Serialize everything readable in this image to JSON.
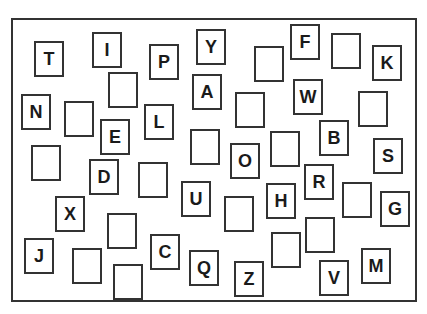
{
  "cards": [
    {
      "letter": "T",
      "x": 34,
      "y": 41
    },
    {
      "letter": "I",
      "x": 92,
      "y": 32
    },
    {
      "letter": "",
      "x": 108,
      "y": 72
    },
    {
      "letter": "P",
      "x": 149,
      "y": 44
    },
    {
      "letter": "Y",
      "x": 196,
      "y": 29
    },
    {
      "letter": "A",
      "x": 192,
      "y": 74
    },
    {
      "letter": "",
      "x": 254,
      "y": 46
    },
    {
      "letter": "F",
      "x": 290,
      "y": 24
    },
    {
      "letter": "",
      "x": 331,
      "y": 33
    },
    {
      "letter": "K",
      "x": 372,
      "y": 45
    },
    {
      "letter": "N",
      "x": 21,
      "y": 94
    },
    {
      "letter": "",
      "x": 64,
      "y": 101
    },
    {
      "letter": "E",
      "x": 100,
      "y": 119
    },
    {
      "letter": "L",
      "x": 144,
      "y": 104
    },
    {
      "letter": "",
      "x": 235,
      "y": 92
    },
    {
      "letter": "W",
      "x": 293,
      "y": 79
    },
    {
      "letter": "",
      "x": 358,
      "y": 91
    },
    {
      "letter": "",
      "x": 190,
      "y": 129
    },
    {
      "letter": "O",
      "x": 230,
      "y": 143
    },
    {
      "letter": "",
      "x": 270,
      "y": 131
    },
    {
      "letter": "B",
      "x": 319,
      "y": 120
    },
    {
      "letter": "S",
      "x": 373,
      "y": 138
    },
    {
      "letter": "",
      "x": 31,
      "y": 145
    },
    {
      "letter": "D",
      "x": 89,
      "y": 159
    },
    {
      "letter": "",
      "x": 138,
      "y": 162
    },
    {
      "letter": "U",
      "x": 181,
      "y": 181
    },
    {
      "letter": "H",
      "x": 266,
      "y": 183
    },
    {
      "letter": "R",
      "x": 304,
      "y": 164
    },
    {
      "letter": "",
      "x": 342,
      "y": 182
    },
    {
      "letter": "G",
      "x": 380,
      "y": 191
    },
    {
      "letter": "X",
      "x": 55,
      "y": 196
    },
    {
      "letter": "",
      "x": 224,
      "y": 196
    },
    {
      "letter": "",
      "x": 107,
      "y": 213
    },
    {
      "letter": "",
      "x": 305,
      "y": 217
    },
    {
      "letter": "C",
      "x": 150,
      "y": 234
    },
    {
      "letter": "",
      "x": 271,
      "y": 232
    },
    {
      "letter": "J",
      "x": 24,
      "y": 238
    },
    {
      "letter": "",
      "x": 72,
      "y": 248
    },
    {
      "letter": "Q",
      "x": 189,
      "y": 250
    },
    {
      "letter": "M",
      "x": 361,
      "y": 248
    },
    {
      "letter": "",
      "x": 113,
      "y": 264
    },
    {
      "letter": "Z",
      "x": 234,
      "y": 261
    },
    {
      "letter": "V",
      "x": 319,
      "y": 260
    }
  ]
}
